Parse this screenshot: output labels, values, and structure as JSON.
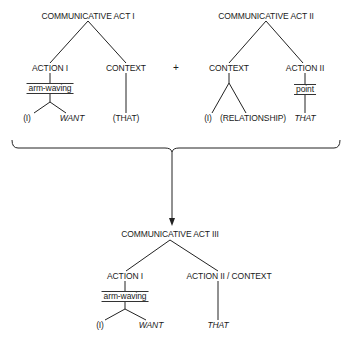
{
  "tree1": {
    "root": "COMMUNICATIVE ACT I",
    "left": {
      "label": "ACTION I",
      "gesture": "arm-waving",
      "children": [
        "(I)",
        "WANT"
      ]
    },
    "right": {
      "label": "CONTEXT",
      "children": [
        "(THAT)"
      ]
    }
  },
  "operator": "+",
  "tree2": {
    "root": "COMMUNICATIVE ACT II",
    "left": {
      "label": "CONTEXT",
      "children": [
        "(I)",
        "(RELATIONSHIP)"
      ]
    },
    "right": {
      "label": "ACTION II",
      "gesture": "point",
      "children": [
        "THAT"
      ]
    }
  },
  "tree3": {
    "root": "COMMUNICATIVE ACT III",
    "left": {
      "label": "ACTION I",
      "gesture": "arm-waving",
      "children": [
        "(I)",
        "WANT"
      ]
    },
    "right": {
      "label": "ACTION II / CONTEXT",
      "children": [
        "THAT"
      ]
    }
  },
  "colors": {
    "line": "#222222",
    "background": "#ffffff"
  }
}
